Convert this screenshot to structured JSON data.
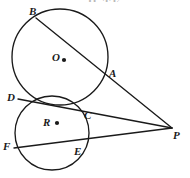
{
  "figure": {
    "title_fragment": "H  TE",
    "stroke_color": "#1a1a1a",
    "background_color": "#ffffff"
  },
  "circles": [
    {
      "name": "circle-o",
      "center_label": "O",
      "center_label_x": 52,
      "center_label_y": 52,
      "dot_x": 64,
      "dot_y": 60,
      "dot_r": 2.1,
      "cx": 60,
      "cy": 57,
      "r": 48
    },
    {
      "name": "circle-r",
      "center_label": "R",
      "center_label_x": 43,
      "center_label_y": 117,
      "dot_x": 57,
      "dot_y": 123,
      "dot_r": 2.1,
      "cx": 52,
      "cy": 133,
      "r": 37
    }
  ],
  "points": [
    {
      "name": "point-b",
      "label": "B",
      "x": 36,
      "y": 18,
      "label_x": 29,
      "label_y": 6
    },
    {
      "name": "point-a",
      "label": "A",
      "x": 105,
      "y": 76,
      "label_x": 109,
      "label_y": 68
    },
    {
      "name": "point-d",
      "label": "D",
      "x": 18,
      "y": 99,
      "label_x": 7,
      "label_y": 92
    },
    {
      "name": "point-c",
      "label": "C",
      "x": 86,
      "y": 108,
      "label_x": 84,
      "label_y": 110
    },
    {
      "name": "point-f",
      "label": "F",
      "x": 14,
      "y": 148,
      "label_x": 3,
      "label_y": 141
    },
    {
      "name": "point-e",
      "label": "E",
      "x": 80,
      "y": 143,
      "label_x": 74,
      "label_y": 146
    },
    {
      "name": "point-p",
      "label": "P",
      "x": 172,
      "y": 128,
      "label_x": 173,
      "label_y": 130
    }
  ],
  "lines": [
    {
      "name": "secant-b-a-p",
      "from": "B",
      "through": "A",
      "to": "P",
      "x1": 36,
      "y1": 18,
      "x2": 172,
      "y2": 128
    },
    {
      "name": "secant-d-c-p",
      "from": "D",
      "through": "C",
      "to": "P",
      "x1": 18,
      "y1": 99,
      "x2": 172,
      "y2": 128
    },
    {
      "name": "secant-f-e-p",
      "from": "F",
      "through": "E",
      "to": "P",
      "x1": 14,
      "y1": 148,
      "x2": 172,
      "y2": 128
    }
  ]
}
